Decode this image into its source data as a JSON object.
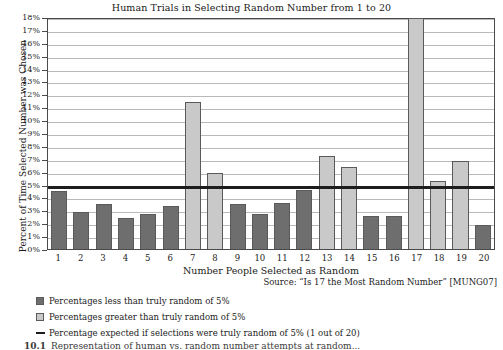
{
  "chart_data": {
    "type": "bar",
    "title": "Human Trials in Selecting Random Number from 1 to 20",
    "xlabel": "Number People Selected as Random",
    "ylabel": "Percent of Time Selected Number was Chosen",
    "categories": [
      "1",
      "2",
      "3",
      "4",
      "5",
      "6",
      "7",
      "8",
      "9",
      "10",
      "11",
      "12",
      "13",
      "14",
      "15",
      "16",
      "17",
      "18",
      "19",
      "20"
    ],
    "values": [
      4.5,
      2.9,
      3.5,
      2.4,
      2.7,
      3.3,
      11.4,
      5.9,
      3.5,
      2.75,
      3.55,
      4.6,
      7.2,
      6.4,
      2.55,
      2.55,
      17.9,
      5.25,
      6.8,
      1.9
    ],
    "ylim": [
      0,
      18
    ],
    "ytick_labels": [
      "0%",
      "1%",
      "2%",
      "3%",
      "4%",
      "5%",
      "6%",
      "7%",
      "8%",
      "9%",
      "10%",
      "11%",
      "12%",
      "13%",
      "14%",
      "15%",
      "16%",
      "17%",
      "18%"
    ],
    "grid": true,
    "legend_position": "below-left",
    "reference_line": {
      "value": 5,
      "color": "#1d1d1d",
      "label": "Percentage expected if selections were truly random of 5% (1 out of 20)"
    },
    "series_colors": {
      "below_threshold": "#6e6e6e",
      "above_threshold": "#c9c9c9"
    },
    "annotations": {
      "source": "Source: “Is 17 the Most Random Number” [MUNG07]"
    }
  },
  "legend": {
    "items": [
      {
        "swatch": "below",
        "label": "Percentages less than truly random of 5%"
      },
      {
        "swatch": "above",
        "label": "Percentages greater than truly random of 5%"
      },
      {
        "swatch": "line",
        "label": "Percentage expected if selections were truly random of 5% (1 out of 20)"
      }
    ]
  },
  "caption": {
    "number": "10.1",
    "text": "Representation of human vs. random number attempts at random..."
  }
}
